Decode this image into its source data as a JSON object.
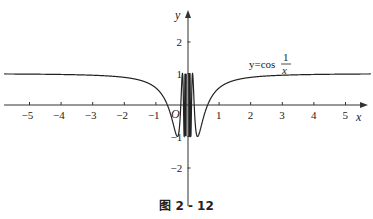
{
  "chart_data": {
    "type": "line",
    "title": "",
    "function": "y = cos(1/x)",
    "series": [
      {
        "name": "y=cos 1/x",
        "x": [
          -5.8,
          -5,
          -4,
          -3,
          -2,
          -1.5,
          -1,
          -0.8,
          -0.6,
          -0.5,
          -0.4,
          -0.318,
          -0.3,
          -0.25,
          -0.2,
          -0.159,
          -0.1,
          0.1,
          0.159,
          0.2,
          0.25,
          0.3,
          0.318,
          0.4,
          0.5,
          0.6,
          0.8,
          1,
          1.5,
          2,
          3,
          4,
          5,
          5.8
        ],
        "y": [
          0.985,
          0.98,
          0.969,
          0.945,
          0.878,
          0.786,
          0.54,
          0.315,
          -0.087,
          -0.416,
          -0.801,
          -1.0,
          -0.984,
          -0.654,
          0.284,
          1.0,
          -0.839,
          -0.839,
          1.0,
          0.284,
          -0.654,
          -0.984,
          -1.0,
          -0.801,
          -0.416,
          -0.087,
          0.315,
          0.54,
          0.786,
          0.878,
          0.945,
          0.969,
          0.98,
          0.985
        ]
      }
    ],
    "xlabel": "x",
    "ylabel": "y",
    "xticks": [
      -5,
      -4,
      -3,
      -2,
      -1,
      1,
      2,
      3,
      4,
      5
    ],
    "yticks": [
      2,
      1,
      -1,
      -2
    ],
    "xlim": [
      -5.8,
      5.8
    ],
    "ylim": [
      -2.8,
      3.0
    ],
    "grid": false,
    "legend": null,
    "annotations": [
      "y=cos 1/x",
      "O"
    ]
  },
  "labels": {
    "x_axis": "x",
    "y_axis": "y",
    "origin": "O",
    "func_prefix": "y=cos",
    "func_num": "1",
    "func_den": "x",
    "xtick_labels": [
      "−5",
      "−4",
      "−3",
      "−2",
      "−1",
      "1",
      "2",
      "3",
      "4",
      "5"
    ],
    "ytick_labels": [
      "2",
      "1",
      "−1",
      "−2"
    ]
  },
  "caption": "图 2 - 12"
}
